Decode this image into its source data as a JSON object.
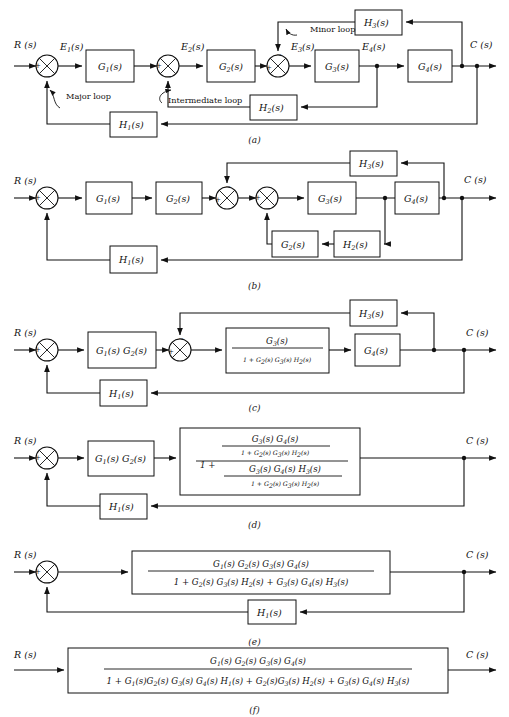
{
  "figure": {
    "kind": "block-diagram-reduction",
    "panel_count": 6,
    "signals": {
      "input": "R (s)",
      "output": "C (s)",
      "e1": "E1(s)",
      "e2": "E2(s)",
      "e3": "E3(s)",
      "e4": "E4(s)"
    },
    "signs": {
      "plus": "+",
      "minus": "−"
    }
  },
  "panels": [
    {
      "id": "a",
      "caption": "(a)",
      "blocks": [
        "G1(s)",
        "G2(s)",
        "G3(s)",
        "G4(s)",
        "H1(s)",
        "H2(s)",
        "H3(s)"
      ],
      "annotations": [
        "Major loop",
        "Intermediate loop",
        "Minor loop"
      ],
      "junctions": 3
    },
    {
      "id": "b",
      "caption": "(b)",
      "blocks": [
        "G1(s)",
        "G2(s)",
        "G3(s)",
        "G4(s)",
        "G2(s)",
        "H1(s)",
        "H2(s)",
        "H3(s)"
      ],
      "annotations": [],
      "junctions": 3
    },
    {
      "id": "c",
      "caption": "(c)",
      "blocks": [
        "G1(s) G2(s)",
        "G4(s)",
        "H1(s)",
        "H3(s)"
      ],
      "fraction": {
        "numerator": "G3(s)",
        "denominator": "1 + G2(s) G3(s) H2(s)"
      },
      "junctions": 2
    },
    {
      "id": "d",
      "caption": "(d)",
      "blocks": [
        "G1(s) G2(s)",
        "H1(s)"
      ],
      "fraction": {
        "numerator_num": "G3(s) G4(s)",
        "numerator_den": "1 + G2(s) G3(s) H2(s)",
        "denominator_lead": "1 +",
        "denominator_num": "G3(s) G4(s) H3(s)",
        "denominator_den": "1 + G2(s) G3(s) H2(s)"
      },
      "junctions": 1
    },
    {
      "id": "e",
      "caption": "(e)",
      "blocks": [
        "H1(s)"
      ],
      "fraction": {
        "numerator": "G1(s) G2(s) G3(s) G4(s)",
        "denominator": "1 + G2(s) G3(s) H2(s) + G3(s) G4(s) H3(s)"
      },
      "junctions": 1
    },
    {
      "id": "f",
      "caption": "(f)",
      "blocks": [],
      "fraction": {
        "numerator": "G1(s) G2(s) G3(s) G4(s)",
        "denominator": "1 + G1(s)G2(s) G3(s) G4(s) H1(s) + G2(s)G3(s) H2(s) + G3(s) G4(s) H3(s)"
      },
      "junctions": 0
    }
  ],
  "labels": {
    "G1": "G",
    "G2": "G",
    "G3": "G",
    "G4": "G",
    "H1": "H",
    "H2": "H",
    "H3": "H",
    "s_paren": "(s)",
    "n1": "1",
    "n2": "2",
    "n3": "3",
    "n4": "4",
    "E": "E",
    "R": "R",
    "C": "C",
    "major_loop": "Major loop",
    "intermediate_loop": "Intermediate loop",
    "minor_loop": "Minor loop",
    "cap_a": "(a)",
    "cap_b": "(b)",
    "cap_c": "(c)",
    "cap_d": "(d)",
    "cap_e": "(e)",
    "cap_f": "(f)",
    "plus": "+",
    "minus": "−",
    "one_plus": "1 +",
    "one": "1"
  },
  "bottom_caption": ""
}
